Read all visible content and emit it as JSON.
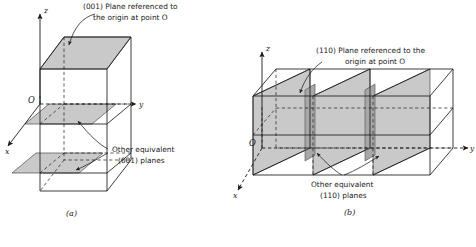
{
  "figure": {
    "background_color": "#ffffff",
    "ink_color": "#1a1a1a",
    "plane_fill_color": "#c9c9c9",
    "plane_fill_dark_color": "#a8a8a8",
    "panels": [
      {
        "id": "a",
        "caption": "(a)",
        "callouts": [
          {
            "name": "primary-plane-callout",
            "line1": "(001) Plane referenced to",
            "line2": "the origin at point O"
          },
          {
            "name": "equivalent-planes-callout",
            "line1": "Other equivalent",
            "line2": "(001) planes"
          }
        ],
        "axes": [
          {
            "name": "z-axis",
            "label": "z"
          },
          {
            "name": "y-axis",
            "label": "y"
          },
          {
            "name": "x-axis",
            "label": "x"
          }
        ],
        "origin_label": "O",
        "plane_count": 3,
        "plane_index": "(001)"
      },
      {
        "id": "b",
        "caption": "(b)",
        "callouts": [
          {
            "name": "primary-plane-callout",
            "line1": "(110) Plane referenced to the",
            "line2": "origin at point O"
          },
          {
            "name": "equivalent-planes-callout",
            "line1": "Other equivalent",
            "line2": "(110) planes"
          }
        ],
        "axes": [
          {
            "name": "z-axis",
            "label": "z"
          },
          {
            "name": "y-axis",
            "label": "y"
          },
          {
            "name": "x-axis",
            "label": "x"
          }
        ],
        "origin_label": "O",
        "plane_count": 3,
        "plane_index": "(110)"
      }
    ]
  }
}
